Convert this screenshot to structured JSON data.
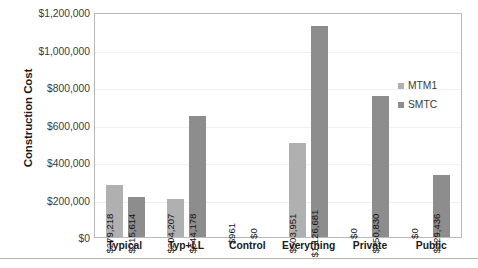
{
  "chart_data": {
    "type": "bar",
    "title": "",
    "xlabel": "",
    "ylabel": "Construction Cost",
    "ylim": [
      0,
      1200000
    ],
    "ytick_values": [
      0,
      200000,
      400000,
      600000,
      800000,
      1000000,
      1200000
    ],
    "ytick_labels": [
      "$0",
      "$200,000",
      "$400,000",
      "$600,000",
      "$800,000",
      "$1,000,000",
      "$1,200,000"
    ],
    "grid": true,
    "legend_position": "right-inside",
    "categories": [
      "Typical",
      "Typ+LL",
      "Control",
      "Everything",
      "Private",
      "Public"
    ],
    "series": [
      {
        "name": "MTM1",
        "color": "#b0b0b0",
        "values": [
          279218,
          204207,
          961,
          503951,
          0,
          0
        ],
        "data_labels": [
          "$279,218",
          "$204,207",
          "$961",
          "$503,951",
          "$0",
          "$0"
        ]
      },
      {
        "name": "SMTC",
        "color": "#8d8d8d",
        "values": [
          215614,
          644178,
          0,
          1126681,
          750830,
          329436
        ],
        "data_labels": [
          "$215,614",
          "$644,178",
          "$0",
          "$1,126,681",
          "$750,830",
          "$329,436"
        ]
      }
    ]
  }
}
